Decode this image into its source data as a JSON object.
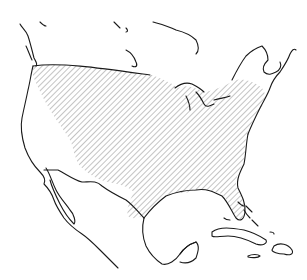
{
  "map": {
    "type": "species-range-map",
    "region": "North America",
    "background_color": "#ffffff",
    "outline_color": "#1a1a1a",
    "hatch_color": "#8a8a8a",
    "legend": null,
    "labels": [],
    "range": {
      "description": "Diagonal-hatched distribution area covering most of the contiguous United States east of the western interior, southern Canada border strip, Florida, northeastern Mexico near the Gulf, and Cuba / Hispaniola",
      "pattern": "diagonal-hatch"
    }
  }
}
